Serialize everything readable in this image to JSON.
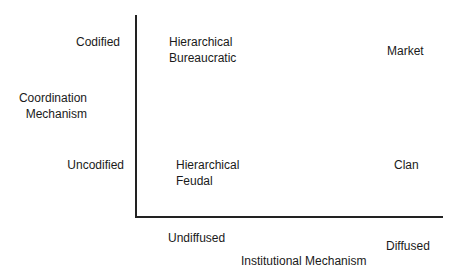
{
  "diagram": {
    "y_axis": {
      "title_line1": "Coordination",
      "title_line2": "Mechanism",
      "tick_top": "Codified",
      "tick_bottom": "Uncodified"
    },
    "x_axis": {
      "title": "Institutional Mechanism",
      "tick_left": "Undiffused",
      "tick_right": "Diffused"
    },
    "quadrants": {
      "top_left": {
        "line1": "Hierarchical",
        "line2": "Bureaucratic"
      },
      "top_right": {
        "line1": "Market"
      },
      "bottom_left": {
        "line1": "Hierarchical",
        "line2": "Feudal"
      },
      "bottom_right": {
        "line1": "Clan"
      }
    }
  }
}
